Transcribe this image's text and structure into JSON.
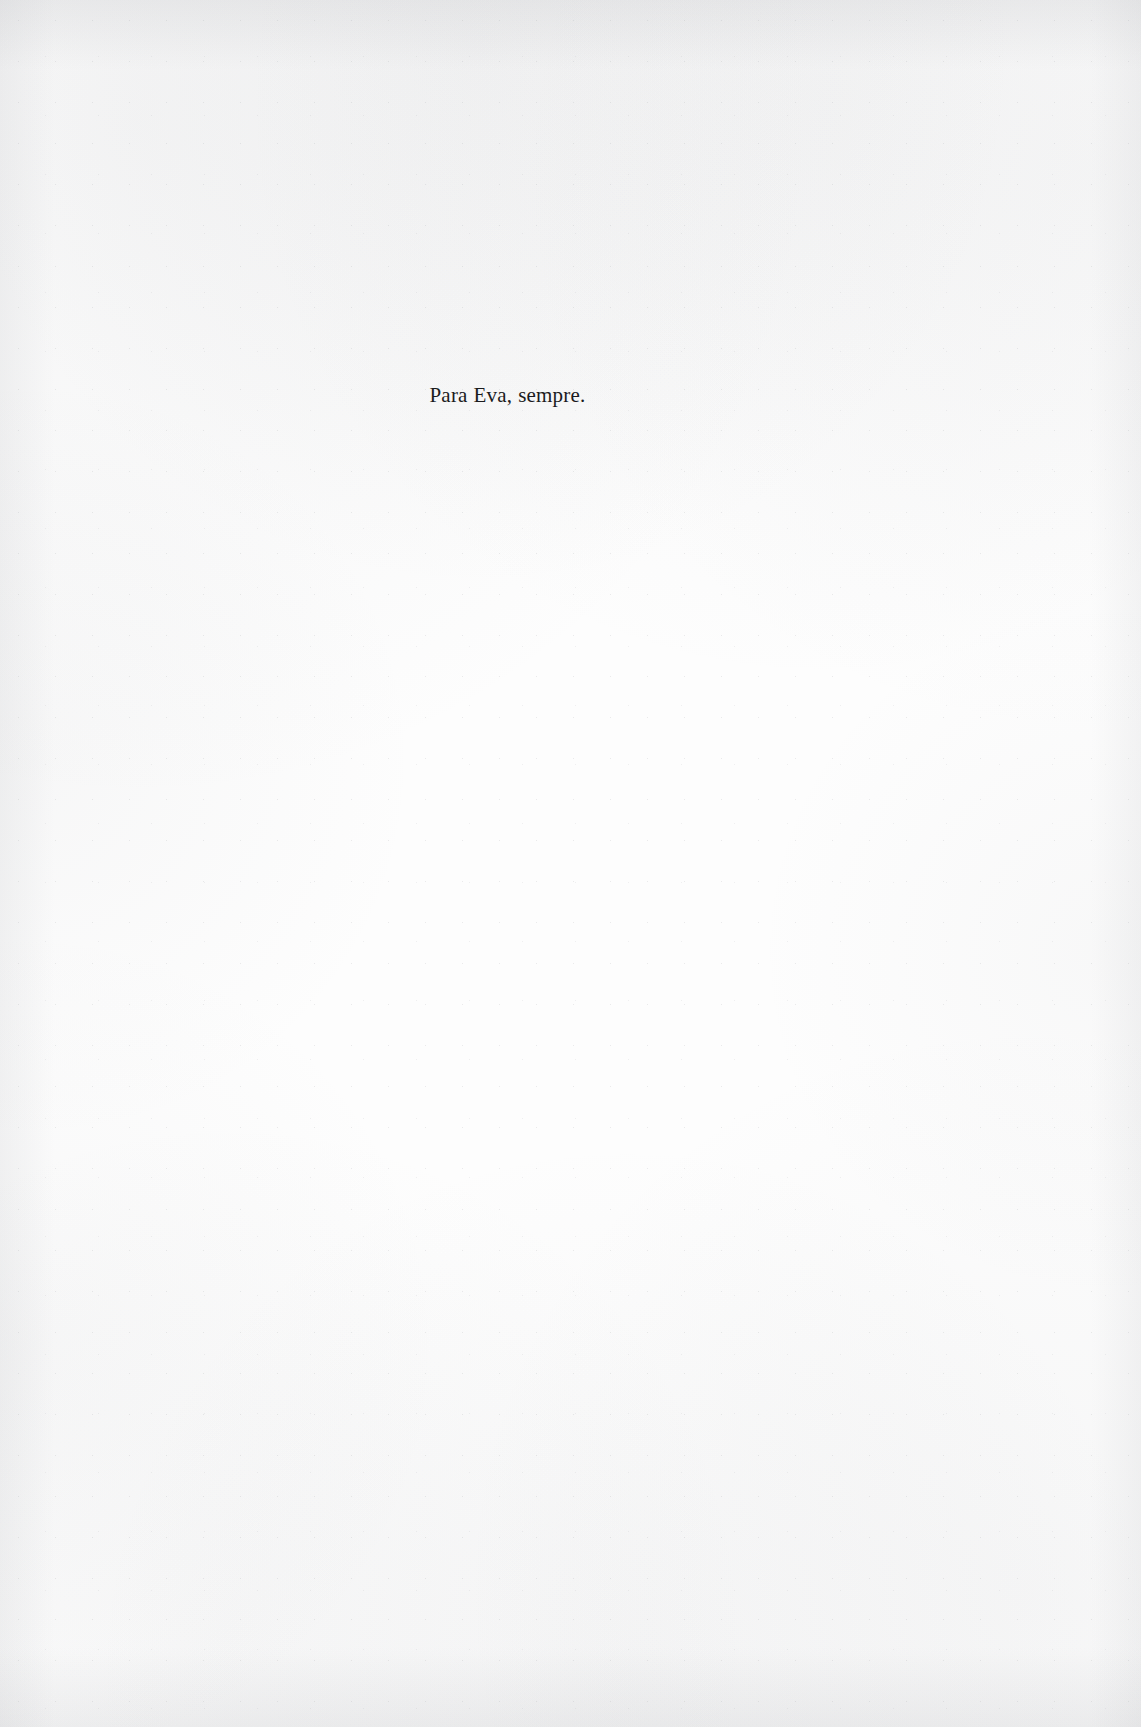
{
  "page": {
    "kind": "book-dedication-page",
    "width": 1141,
    "height": 1727,
    "background_color": "#fdfdfd",
    "ink_color": "#1b1b1d",
    "edge_tint_color": "#94969c"
  },
  "dedication": {
    "text": "Para Eva, sempre.",
    "language": "pt",
    "alignment": "center"
  }
}
